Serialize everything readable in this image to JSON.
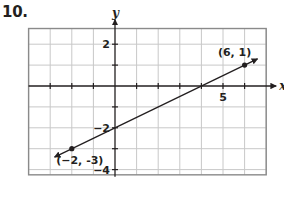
{
  "problem": {
    "number": "10."
  },
  "chart_data": {
    "type": "line",
    "title": "",
    "xlabel": "x",
    "ylabel": "y",
    "xlim": [
      -4,
      7
    ],
    "ylim": [
      -4.25,
      2.75
    ],
    "grid": true,
    "x_ticks": [
      -3,
      -2,
      -1,
      1,
      2,
      3,
      4,
      5,
      6
    ],
    "y_ticks": [
      -4,
      -3,
      -2,
      -1,
      1,
      2
    ],
    "x_tick_labels": [
      {
        "value": 5,
        "text": "5"
      }
    ],
    "y_tick_labels": [
      {
        "value": 2,
        "text": "2"
      },
      {
        "value": -2,
        "text": "-2"
      },
      {
        "value": -4,
        "text": "-4"
      }
    ],
    "series": [
      {
        "name": "line",
        "equation": "y = 0.5x - 2",
        "slope": 0.5,
        "intercept": -2,
        "x_range": [
          -2.8,
          6.6
        ],
        "arrows": "both"
      }
    ],
    "points": [
      {
        "x": -2,
        "y": -3,
        "label": "(−2, -3)"
      },
      {
        "x": 6,
        "y": 1,
        "label": "(6, 1)"
      }
    ],
    "colors": {
      "grid": "#c8c8c8",
      "axis": "#231f20",
      "border": "#8a8a8a",
      "line": "#231f20"
    }
  }
}
